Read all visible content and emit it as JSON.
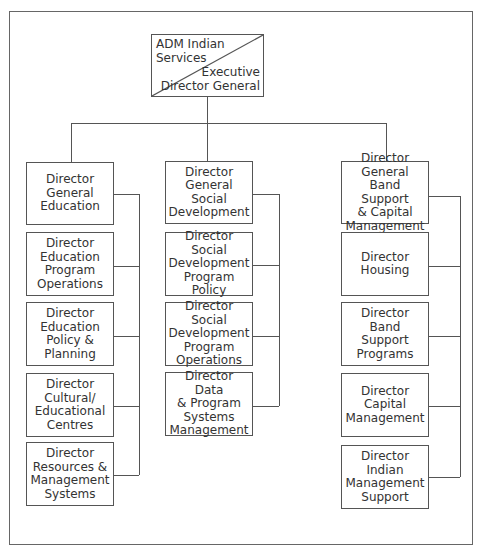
{
  "chart_title": "",
  "top": {
    "upper_left": "ADM Indian\nServices",
    "lower_right": "Executive\nDirector General"
  },
  "columns": [
    {
      "name": "education",
      "boxes": [
        "Director\nGeneral\nEducation",
        "Director\nEducation\nProgram\nOperations",
        "Director\nEducation\nPolicy &\nPlanning",
        "Director\nCultural/\nEducational\nCentres",
        "Director\nResources &\nManagement\nSystems"
      ]
    },
    {
      "name": "social-development",
      "boxes": [
        "Director\nGeneral\nSocial\nDevelopment",
        "Director Social\nDevelopment\nProgram Policy",
        "Director Social\nDevelopment\nProgram\nOperations",
        "Director Data\n& Program\nSystems\nManagement"
      ]
    },
    {
      "name": "band-support",
      "boxes": [
        "Director General\nBand Support\n& Capital\nManagement",
        "Director\nHousing",
        "Director\nBand Support\nPrograms",
        "Director\nCapital\nManagement",
        "Director Indian\nManagement\nSupport"
      ]
    }
  ],
  "colors": {
    "line": "#555555",
    "text": "#333333",
    "background": "#ffffff"
  }
}
